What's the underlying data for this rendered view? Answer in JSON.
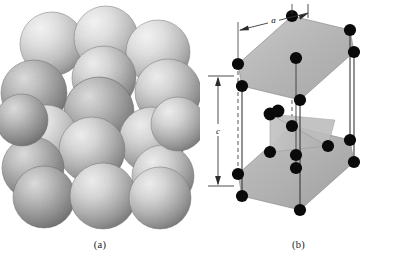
{
  "figure": {
    "background_color": "#ffffff",
    "width": 397,
    "height": 274
  },
  "panels": [
    {
      "id": "a",
      "caption": "(a)",
      "kind": "hard-sphere-model",
      "description": "Hard-sphere unit cell representation: cluster of shaded spheres in hexagonal close-packed arrangement",
      "sphere_count": 17,
      "sphere_fill_light": "#e2e2e2",
      "sphere_fill_mid": "#b8b8b8",
      "sphere_fill_dark": "#7e7e7e",
      "sphere_edge": "#6b6b6b"
    },
    {
      "id": "b",
      "caption": "(b)",
      "kind": "reduced-sphere-unit-cell",
      "description": "Reduced-sphere unit cell with hexagonal top and bottom faces, midplane triangle of atoms, and lattice parameters",
      "atom_color": "#0a0a0a",
      "face_fill": "#b5b5b5",
      "face_fill_mid": "#c9c9c9",
      "edge_color": "#2b2b2b",
      "dashed_edge_color": "#555555",
      "dimensions": [
        {
          "name": "a-dimension",
          "label": "a",
          "orientation": "horizontal",
          "position": "top"
        },
        {
          "name": "c-dimension",
          "label": "c",
          "orientation": "vertical",
          "position": "left"
        }
      ],
      "atom_count_visible": 20
    }
  ]
}
